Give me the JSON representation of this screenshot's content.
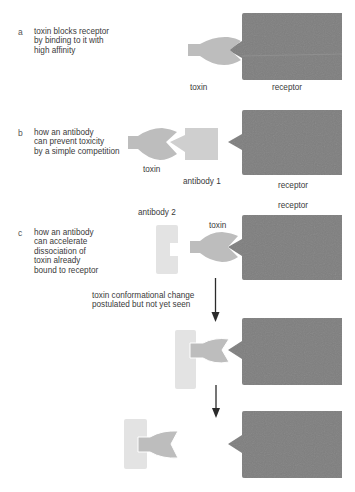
{
  "colors": {
    "receptor": "#7f7f7f",
    "toxin": "#bdbdbd",
    "antibody1": "#cfcfcf",
    "antibody2": "#e3e3e3",
    "arrow": "#2b2b2b",
    "text": "#3a3a3a"
  },
  "panels": {
    "a": {
      "letter": "a",
      "description": "toxin blocks receptor\nby binding to it with\nhigh affinity",
      "labels": {
        "toxin": "toxin",
        "receptor": "receptor"
      }
    },
    "b": {
      "letter": "b",
      "description": "how an antibody\ncan prevent toxicity\nby a simple competition",
      "labels": {
        "toxin": "toxin",
        "antibody": "antibody 1",
        "receptor": "receptor"
      }
    },
    "c": {
      "letter": "c",
      "description": "how an antibody\ncan accelerate\ndissociation of\ntoxin already\nbound to receptor",
      "labels": {
        "antibody": "antibody 2",
        "toxin": "toxin",
        "receptor": "receptor"
      },
      "step_note": "toxin conformational change\npostulated but not yet seen"
    }
  }
}
